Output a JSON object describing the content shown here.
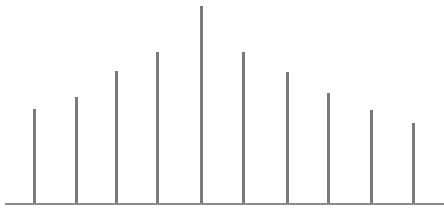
{
  "chart_data": {
    "type": "bar",
    "subtype": "stem",
    "title": "",
    "xlabel": "",
    "ylabel": "",
    "categories": [
      "1",
      "2",
      "3",
      "4",
      "5",
      "6",
      "7",
      "8",
      "9",
      "10"
    ],
    "values": [
      94,
      106,
      132,
      151,
      197,
      151,
      131,
      110,
      93,
      80
    ],
    "x_positions_px": [
      34,
      76,
      116,
      157,
      201,
      243,
      287,
      328,
      371,
      413
    ],
    "ylim": [
      0,
      200
    ],
    "grid": false,
    "legend": null,
    "axes_visible": {
      "x_baseline": true,
      "y_axis": false,
      "tick_labels": false
    }
  },
  "style": {
    "stem_color": "#7a7a7a",
    "baseline_color": "#8a8a8a",
    "background": "#ffffff",
    "baseline_y_px": 203,
    "baseline_x_start_px": 5,
    "baseline_x_end_px": 444
  }
}
